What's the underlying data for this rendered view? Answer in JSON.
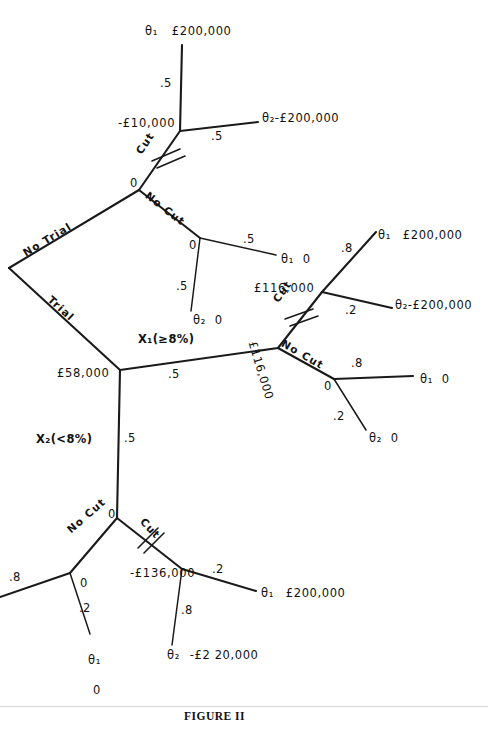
{
  "figure": {
    "caption": "FIGURE II"
  },
  "symbols": {
    "theta": "θ",
    "greater_equal": "≥"
  },
  "root": {
    "branches": [
      {
        "label": "No Trial"
      },
      {
        "label": "Trial"
      }
    ]
  },
  "labels": {
    "no_trial": "No Trial",
    "trial": "Trial",
    "cut": "Cut",
    "no_cut": "No Cut",
    "x1_test": "X₁(≥8%)",
    "x2_test": "X₂(<8%)",
    "zero": "0"
  },
  "no_trial_subtree": {
    "decision_node_value": "0",
    "cut_branch": {
      "label": "Cut",
      "pruned": true,
      "chance_node_value": "-£10,000",
      "outcomes": [
        {
          "prob": ".5",
          "state": "θ₁",
          "payoff": "£200,000"
        },
        {
          "prob": ".5",
          "state": "θ₂",
          "payoff": "-£200,000"
        }
      ]
    },
    "no_cut_branch": {
      "label": "No Cut",
      "pruned": false,
      "chance_node_value": "0",
      "outcomes": [
        {
          "prob": ".5",
          "state": "θ₁",
          "payoff": "0"
        },
        {
          "prob": ".5",
          "state": "θ₂",
          "payoff": "0"
        }
      ]
    }
  },
  "trial_subtree": {
    "chance_node_value": "£58,000",
    "x1_branch": {
      "test_label": "X₁(≥8%)",
      "prob": ".5",
      "decision_node_value": "£116,000",
      "cut_branch": {
        "label": "Cut",
        "pruned": true,
        "chance_node_value": "£116,000",
        "outcomes": [
          {
            "prob": ".8",
            "state": "θ₁",
            "payoff": "£200,000"
          },
          {
            "prob": ".2",
            "state": "θ₂",
            "payoff": "-£200,000"
          }
        ]
      },
      "no_cut_branch": {
        "label": "No Cut",
        "pruned": false,
        "chance_node_value": "0",
        "outcomes": [
          {
            "prob": ".8",
            "state": "θ₁",
            "payoff": "0"
          },
          {
            "prob": ".2",
            "state": "θ₂",
            "payoff": "0"
          }
        ]
      }
    },
    "x2_branch": {
      "test_label": "X₂(<8%)",
      "prob": ".5",
      "decision_node_value": "0",
      "no_cut_branch": {
        "label": "No Cut",
        "pruned": false,
        "chance_node_value": "0",
        "outcomes": [
          {
            "prob": ".8",
            "state": "θ₁",
            "payoff": "0"
          },
          {
            "prob": ".2",
            "state": "θ₂",
            "payoff": ""
          }
        ]
      },
      "cut_branch": {
        "label": "Cut",
        "pruned": true,
        "chance_node_value": "-£136,000",
        "outcomes": [
          {
            "prob": ".2",
            "state": "θ₁",
            "payoff": "£200,000"
          },
          {
            "prob": ".8",
            "state": "θ₂",
            "payoff": "-£2 20,000"
          }
        ]
      }
    }
  },
  "text_items": {
    "t_theta1_top": "θ₁",
    "t_money_200k_top": "£200,000",
    "t_prob_05_a": ".5",
    "t_money_neg10k": "-£10,000",
    "t_prob_05_b": ".5",
    "t_theta2_top": "θ₂",
    "t_money_neg200k_top": "-£200,000",
    "t_cut_1": "Cut",
    "t_node_0_a": "0",
    "t_no_cut_1": "No Cut",
    "t_node_0_b": "0",
    "t_prob_05_c": ".5",
    "t_theta1_mid": "θ₁",
    "t_zero_mid_a": "0",
    "t_prob_05_d": ".5",
    "t_theta2_mid": "θ₂",
    "t_zero_mid_b": "0",
    "t_no_trial": "No Trial",
    "t_trial": "Trial",
    "t_money_116k_node": "£116,000",
    "t_cut_2": "Cut",
    "t_prob_08_a": ".8",
    "t_theta1_r1": "θ₁",
    "t_money_200k_r1": "£200,000",
    "t_prob_02_a": ".2",
    "t_theta2_r1": "θ₂",
    "t_money_neg200k_r1": "-£200,000",
    "t_no_cut_2": "No Cut",
    "t_node_0_c": "0",
    "t_prob_08_b": ".8",
    "t_theta1_r2": "θ₁",
    "t_zero_r2": "0",
    "t_prob_02_b": ".2",
    "t_theta2_r2": "θ₂",
    "t_zero_r3": "0",
    "t_x1": "X₁(≥8%)",
    "t_money_58k": "£58,000",
    "t_prob_05_e": ".5",
    "t_money_116k_rot": "£116,000",
    "t_x2": "X₂(<8%)",
    "t_prob_05_f": ".5",
    "t_node_0_d": "0",
    "t_no_cut_3": "No Cut",
    "t_cut_3": "Cut",
    "t_prob_08_c": ".8",
    "t_node_0_e": "0",
    "t_prob_02_c": ".2",
    "t_theta1_bl": "θ₁",
    "t_zero_bl": "0",
    "t_money_neg136k": "-£136,000",
    "t_prob_02_d": ".2",
    "t_theta1_br": "θ₁",
    "t_money_200k_br": "£200,000",
    "t_prob_08_d": ".8",
    "t_theta2_br": "θ₂",
    "t_money_neg220k": "-£2 20,000"
  }
}
